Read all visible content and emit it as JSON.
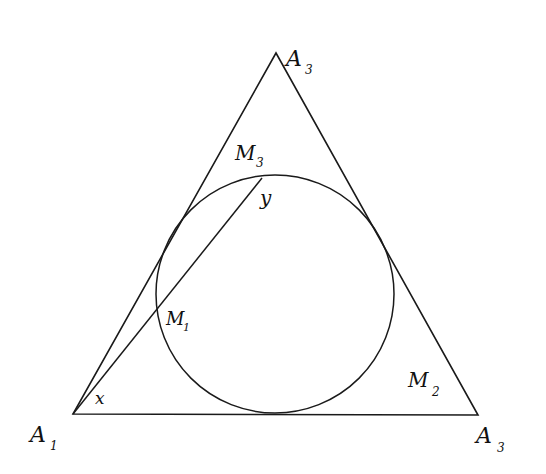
{
  "diagram": {
    "type": "geometry",
    "stroke_color": "#1a1a1a",
    "triangle": {
      "vertices": {
        "apex": {
          "x": 276,
          "y": 53
        },
        "bottom_left": {
          "x": 73,
          "y": 414
        },
        "bottom_right": {
          "x": 478,
          "y": 415
        }
      }
    },
    "circle": {
      "cx": 275,
      "cy": 294,
      "r": 119
    },
    "chord_line": {
      "x1": 73,
      "y1": 414,
      "x2": 262,
      "y2": 178
    }
  },
  "labels": {
    "apex": {
      "main": "A",
      "sub": "3"
    },
    "bottom_left": {
      "main": "A",
      "sub": "1"
    },
    "bottom_right": {
      "main": "A",
      "sub": "3"
    },
    "m3": {
      "main": "M",
      "sub": "3"
    },
    "m2": {
      "main": "M",
      "sub": "2"
    },
    "m1": {
      "main": "M",
      "sub": "1"
    },
    "y": "y",
    "x": "x"
  }
}
